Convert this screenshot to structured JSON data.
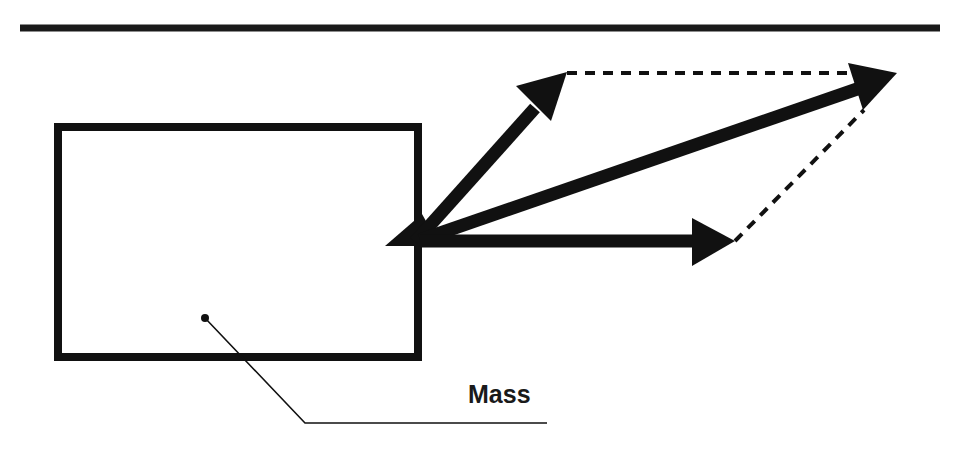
{
  "diagram": {
    "type": "vector-force-diagram",
    "colors": {
      "ink": "#111111",
      "background": "#ffffff"
    },
    "labels": {
      "mass": "Mass"
    },
    "elements": {
      "top_rule": {
        "x1": 20,
        "y1": 28,
        "x2": 940,
        "y2": 28
      },
      "mass_box": {
        "x": 58,
        "y": 127,
        "width": 360,
        "height": 230
      },
      "origin": {
        "x": 420,
        "y": 240
      },
      "force_upper": {
        "tip": {
          "x": 565,
          "y": 73
        }
      },
      "force_horizontal": {
        "tip": {
          "x": 735,
          "y": 241
        }
      },
      "resultant": {
        "tip": {
          "x": 897,
          "y": 74
        }
      },
      "center_of_mass_dot": {
        "x": 205,
        "y": 318
      },
      "leader_line": {
        "points": [
          [
            205,
            318
          ],
          [
            305,
            423
          ],
          [
            547,
            423
          ]
        ]
      }
    }
  }
}
